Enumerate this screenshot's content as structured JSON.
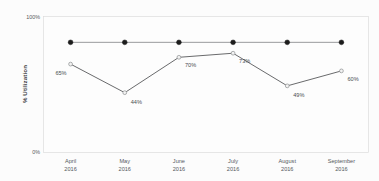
{
  "chart_data": {
    "type": "line",
    "title": "",
    "xlabel": "",
    "ylabel": "% Utilization",
    "ylim": [
      0,
      100
    ],
    "grid": false,
    "legend": "none",
    "categories": [
      "April\n2016",
      "May\n2016",
      "June\n2016",
      "July\n2016",
      "August\n2016",
      "September\n2016"
    ],
    "category_months": [
      "April",
      "May",
      "June",
      "July",
      "August",
      "September"
    ],
    "category_years": [
      "2016",
      "2016",
      "2016",
      "2016",
      "2016",
      "2016"
    ],
    "series": [
      {
        "name": "Target",
        "values": [
          81,
          81,
          81,
          81,
          81,
          81
        ],
        "marker": "filled-circle",
        "color": "#1c1c1c",
        "labels_shown": false,
        "point_labels": [
          "",
          "",
          "",
          "",
          "",
          ""
        ]
      },
      {
        "name": "% Utilization",
        "values": [
          65,
          44,
          70,
          73,
          49,
          60
        ],
        "marker": "open-circle",
        "color": "#58595b",
        "labels_shown": true,
        "point_labels": [
          "65%",
          "44%",
          "70%",
          "73%",
          "49%",
          "60%"
        ]
      }
    ],
    "ytick_labels": [
      "100%",
      "0%"
    ],
    "ytick_values": [
      100,
      0
    ]
  },
  "axis": {
    "y_title": "% Utilization",
    "y_top": "100%",
    "y_bottom": "0%"
  }
}
